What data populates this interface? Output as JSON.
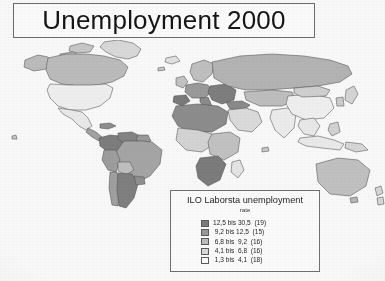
{
  "title": {
    "text": "Unemployment 2000"
  },
  "legend": {
    "title": "ILO Laborsta unemployment",
    "subtitle": "rate",
    "rows": [
      {
        "label": "12,5 bis 30,5  (19)",
        "from": 12.5,
        "to": 30.5,
        "count": 19,
        "color": "#7b7b7b"
      },
      {
        "label": " 9,2 bis 12,5  (15)",
        "from": 9.2,
        "to": 12.5,
        "count": 15,
        "color": "#9a9a9a"
      },
      {
        "label": " 6,8 bis  9,2  (16)",
        "from": 6.8,
        "to": 9.2,
        "count": 16,
        "color": "#bdbdbd"
      },
      {
        "label": " 4,1 bis  6,8  (16)",
        "from": 4.1,
        "to": 6.8,
        "count": 16,
        "color": "#dcdcdc"
      },
      {
        "label": " 1,3 bis  4,1  (18)",
        "from": 1.3,
        "to": 4.1,
        "count": 18,
        "color": "#ffffff"
      }
    ]
  },
  "chart_data": {
    "type": "map",
    "title": "Unemployment 2000",
    "legend_title": "ILO Laborsta unemployment",
    "legend_subtitle": "rate",
    "unit": "percent",
    "value_separator": "bis",
    "classes": [
      {
        "range": "12,5 bis 30,5",
        "min": 12.5,
        "max": 30.5,
        "country_count": 19,
        "color": "#7b7b7b"
      },
      {
        "range": "9,2 bis 12,5",
        "min": 9.2,
        "max": 12.5,
        "country_count": 15,
        "color": "#9a9a9a"
      },
      {
        "range": "6,8 bis 9,2",
        "min": 6.8,
        "max": 9.2,
        "country_count": 16,
        "color": "#bdbdbd"
      },
      {
        "range": "4,1 bis 6,8",
        "min": 4.1,
        "max": 6.8,
        "country_count": 16,
        "color": "#dcdcdc"
      },
      {
        "range": "1,3 bis 4,1",
        "min": 1.3,
        "max": 4.1,
        "country_count": 18,
        "color": "#ffffff"
      }
    ],
    "total_countries": 84,
    "regions": [
      {
        "name": "canada",
        "class_index": 2
      },
      {
        "name": "united-states",
        "class_index": 4
      },
      {
        "name": "greenland",
        "class_index": 3
      },
      {
        "name": "mexico",
        "class_index": 4
      },
      {
        "name": "central-america",
        "class_index": 1
      },
      {
        "name": "colombia",
        "class_index": 0
      },
      {
        "name": "venezuela",
        "class_index": 0
      },
      {
        "name": "brazil",
        "class_index": 1
      },
      {
        "name": "peru",
        "class_index": 1
      },
      {
        "name": "bolivia",
        "class_index": 2
      },
      {
        "name": "argentina",
        "class_index": 0
      },
      {
        "name": "chile",
        "class_index": 1
      },
      {
        "name": "scandinavia",
        "class_index": 2
      },
      {
        "name": "western-europe",
        "class_index": 1
      },
      {
        "name": "spain",
        "class_index": 0
      },
      {
        "name": "eastern-europe",
        "class_index": 0
      },
      {
        "name": "russia",
        "class_index": 2
      },
      {
        "name": "north-africa",
        "class_index": 0
      },
      {
        "name": "west-africa",
        "class_index": 3
      },
      {
        "name": "south-africa",
        "class_index": 0
      },
      {
        "name": "middle-east",
        "class_index": 3
      },
      {
        "name": "central-asia",
        "class_index": 2
      },
      {
        "name": "china",
        "class_index": 4
      },
      {
        "name": "india",
        "class_index": 4
      },
      {
        "name": "japan",
        "class_index": 3
      },
      {
        "name": "korea",
        "class_index": 3
      },
      {
        "name": "southeast-asia",
        "class_index": 4
      },
      {
        "name": "indonesia",
        "class_index": 4
      },
      {
        "name": "australia",
        "class_index": 2
      },
      {
        "name": "new-zealand",
        "class_index": 3
      },
      {
        "name": "madagascar",
        "class_index": 4
      }
    ]
  }
}
